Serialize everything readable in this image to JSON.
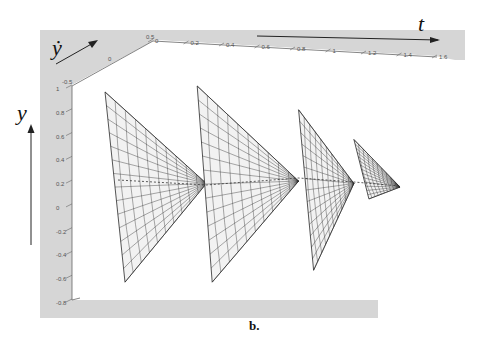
{
  "figure": {
    "caption": "b."
  },
  "chart_data": {
    "type": "surface3d",
    "title": "",
    "axes": {
      "t": {
        "label": "t",
        "ticks": [
          "0",
          "0.2",
          "0.4",
          "0.6",
          "0.8",
          "1",
          "1.2",
          "1.4",
          "1.6"
        ],
        "range": [
          0,
          1.6
        ]
      },
      "y": {
        "label": "y",
        "ticks": [
          "1",
          "0.8",
          "0.6",
          "0.4",
          "0.2",
          "0",
          "-0.2",
          "-0.4",
          "-0.6",
          "-0.8"
        ],
        "range": [
          -0.8,
          1
        ]
      },
      "ydot": {
        "label": "ẏ",
        "ticks": [
          "-0.5",
          "0",
          "0.5"
        ],
        "range": [
          -0.5,
          0.5
        ]
      }
    },
    "surfaces": [
      {
        "name": "segment-1",
        "t_range": [
          0.0,
          0.5
        ],
        "y_top": 0.95,
        "y_bottom": -0.65,
        "apex_t": 0.55,
        "apex_y": 0.18
      },
      {
        "name": "segment-2",
        "t_range": [
          0.5,
          1.05
        ],
        "y_top": 1.0,
        "y_bottom": -0.65,
        "apex_t": 1.05,
        "apex_y": 0.2
      },
      {
        "name": "segment-3",
        "t_range": [
          1.05,
          1.35
        ],
        "y_top": 0.8,
        "y_bottom": -0.55,
        "apex_t": 1.35,
        "apex_y": 0.18
      },
      {
        "name": "segment-4",
        "t_range": [
          1.35,
          1.6
        ],
        "y_top": 0.55,
        "y_bottom": 0.05,
        "apex_t": 1.6,
        "apex_y": 0.15
      }
    ],
    "grid": false,
    "legend": "none",
    "colors": {
      "panel": "#d6d6d6",
      "mesh": "#2a2a2a",
      "surface_fill": "#f2f2f2"
    }
  }
}
